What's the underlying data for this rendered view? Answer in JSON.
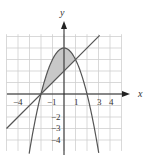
{
  "chart_data": {
    "type": "line",
    "title": "",
    "xlabel": "x",
    "ylabel": "y",
    "xlim": [
      -5,
      5
    ],
    "ylim": [
      -5,
      5
    ],
    "grid": true,
    "x_ticks_labeled": [
      -4,
      -1,
      1,
      3,
      4
    ],
    "y_ticks_labeled": [
      -2,
      -3,
      -4
    ],
    "series": [
      {
        "name": "parabola",
        "equation": "y = 4 - x^2",
        "vertex": [
          0,
          4
        ]
      },
      {
        "name": "line",
        "equation": "y = x + 2"
      }
    ],
    "shaded_region": {
      "between": [
        "y = 4 - x^2",
        "y = x + 2"
      ],
      "x_from": -2,
      "x_to": 1,
      "fill": "#c8c8c8"
    },
    "intersections": [
      [
        -2,
        0
      ],
      [
        1,
        3
      ]
    ]
  },
  "labels": {
    "x_axis": "x",
    "y_axis": "y",
    "xt": [
      "−4",
      "−1",
      "1",
      "3",
      "4"
    ],
    "yt": [
      "−2",
      "−3",
      "−4"
    ]
  },
  "colors": {
    "grid": "#cfcfcf",
    "curve": "#555555",
    "axis": "#222222",
    "shade": "#c8c8c8"
  }
}
